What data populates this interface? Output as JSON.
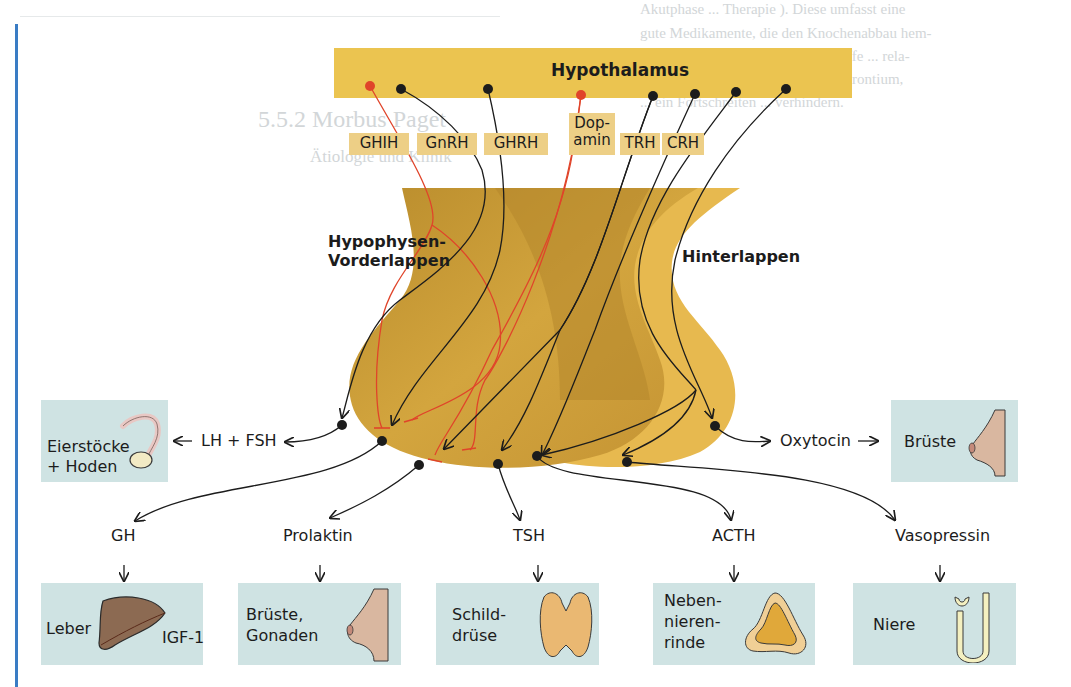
{
  "background_text_lines": [
    "Akutphase ... Therapie ). Diese umfasst eine",
    "gute Medikamente, die den Knochenabbau hem-",
    "z. B. Calcitonin), mineralische Stoffe ... rela-",
    "... Anstieg z. B. Bisphosphonate, Strontium,",
    "... ein Fortschreiten ... verhindern.",
    "5.5.2 Morbus Paget",
    "Ätiologie und Klinik"
  ],
  "diagram": {
    "hypothalamus": {
      "label": "Hypothalamus",
      "color": "#ebc450"
    },
    "releasing_hormones": [
      {
        "id": "ghih",
        "label": "GHIH",
        "inhibitory": true
      },
      {
        "id": "gnrh",
        "label": "GnRH",
        "inhibitory": false
      },
      {
        "id": "ghrh",
        "label": "GHRH",
        "inhibitory": false
      },
      {
        "id": "dopamin",
        "label": "Dop-\namin",
        "label_line1": "Dop-",
        "label_line2": "amin",
        "inhibitory": true
      },
      {
        "id": "trh",
        "label": "TRH",
        "inhibitory": false
      },
      {
        "id": "crh",
        "label": "CRH",
        "inhibitory": false
      }
    ],
    "lobes": {
      "anterior": {
        "line1": "Hypophysen-",
        "line2": "Vorderlappen",
        "color": "#c99a33"
      },
      "posterior": {
        "label": "Hinterlappen",
        "color": "#e7b94f"
      }
    },
    "pituitary_hormones": [
      {
        "id": "lh_fsh",
        "label": "LH + FSH",
        "target_box": "eierstoecke"
      },
      {
        "id": "gh",
        "label": "GH",
        "target_box": "leber"
      },
      {
        "id": "prolaktin",
        "label": "Prolaktin",
        "target_box": "brueste_gonaden"
      },
      {
        "id": "tsh",
        "label": "TSH",
        "target_box": "schilddruese"
      },
      {
        "id": "acth",
        "label": "ACTH",
        "target_box": "nebenniere"
      },
      {
        "id": "vasopressin",
        "label": "Vasopressin",
        "target_box": "niere"
      },
      {
        "id": "oxytocin",
        "label": "Oxytocin",
        "target_box": "brueste"
      }
    ],
    "target_organs": {
      "eierstoecke": {
        "line1": "Eierstöcke",
        "line2": "+ Hoden",
        "icon": "ovary-icon"
      },
      "brueste": {
        "label": "Brüste",
        "icon": "breast-icon"
      },
      "leber": {
        "label": "Leber",
        "output": "IGF-1",
        "icon": "liver-icon"
      },
      "brueste_gonaden": {
        "line1": "Brüste,",
        "line2": "Gonaden",
        "icon": "breast-icon"
      },
      "schilddruese": {
        "line1": "Schild-",
        "line2": "drüse",
        "icon": "thyroid-icon"
      },
      "nebenniere": {
        "line1": "Neben-",
        "line2": "nieren-",
        "line3": "rinde",
        "icon": "adrenal-icon"
      },
      "niere": {
        "label": "Niere",
        "icon": "nephron-icon"
      }
    },
    "colors": {
      "accent_blue_rule": "#3a7cc4",
      "box_fill": "#cfe3e3",
      "rh_box_fill": "#edcf86",
      "inhibitory_red": "#e0442a",
      "stimulatory_black": "#1c1c1c"
    }
  }
}
